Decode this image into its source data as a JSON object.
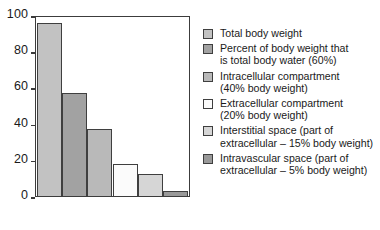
{
  "chart_data": {
    "type": "bar",
    "title": "",
    "subtitle": "",
    "xlabel": "",
    "ylabel": "",
    "ylim": [
      0,
      100
    ],
    "xticklabels": [],
    "yticks": [
      "0",
      "20",
      "40",
      "60",
      "80",
      "100"
    ],
    "grid": false,
    "legend_position": "right",
    "categories": [
      "Total body weight",
      "Percent of body weight that is total body water (60%)",
      "Intracellular compartment (40% body weight)",
      "Extracellular compartment (20% body weight)",
      "Interstitial space (part of extracellular – 15% body weight)",
      "Intravascular space (part of extracellular – 5% body weight)"
    ],
    "values": [
      97,
      57.5,
      37.5,
      17.5,
      12,
      2.5
    ],
    "colors": [
      "#c2c2c2",
      "#a2a2a2",
      "#b9b9b9",
      "#fbfbfb",
      "#d6d6d6",
      "#999999"
    ],
    "bar_edge_color": "#3f3f3f",
    "axis_color": "#3c3c3c"
  },
  "legend": {
    "items": [
      {
        "label": "Total body weight",
        "color": "#c2c2c2",
        "swatch_name": "legend-swatch-total-body-weight"
      },
      {
        "label": "Percent of body weight that\nis total body water (60%)",
        "color": "#a2a2a2",
        "swatch_name": "legend-swatch-total-body-water"
      },
      {
        "label": "Intracellular compartment\n(40% body weight)",
        "color": "#b9b9b9",
        "swatch_name": "legend-swatch-intracellular"
      },
      {
        "label": "Extracellular compartment\n(20% body weight)",
        "color": "#fbfbfb",
        "swatch_name": "legend-swatch-extracellular"
      },
      {
        "label": "Interstitial space (part of\nextracellular – 15% body weight)",
        "color": "#d6d6d6",
        "swatch_name": "legend-swatch-interstitial"
      },
      {
        "label": "Intravascular space (part of\nextracellular – 5% body weight)",
        "color": "#999999",
        "swatch_name": "legend-swatch-intravascular"
      }
    ]
  }
}
